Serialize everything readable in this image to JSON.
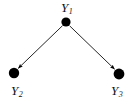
{
  "figure": {
    "type": "directed-acyclic-graph",
    "background_color": "#ffffff",
    "ink_color": "#000000",
    "width": 133,
    "height": 104
  },
  "nodes": [
    {
      "id": "Y1",
      "label_base": "Y",
      "label_sub": "1",
      "name": "node-y1",
      "cx": 66,
      "cy": 22,
      "r": 4.6,
      "label_position": "above"
    },
    {
      "id": "Y2",
      "label_base": "Y",
      "label_sub": "2",
      "name": "node-y2",
      "cx": 14,
      "cy": 73,
      "r": 5.2,
      "label_position": "below"
    },
    {
      "id": "Y3",
      "label_base": "Y",
      "label_sub": "3",
      "name": "node-y3",
      "cx": 119,
      "cy": 74,
      "r": 5.4,
      "label_position": "below"
    }
  ],
  "edges": [
    {
      "from": "Y1",
      "to": "Y2",
      "name": "edge-y1-to-y2",
      "arrowhead": "filled-triangle",
      "style": "solid"
    },
    {
      "from": "Y1",
      "to": "Y3",
      "name": "edge-y1-to-y3",
      "arrowhead": "filled-triangle",
      "style": "solid"
    }
  ]
}
